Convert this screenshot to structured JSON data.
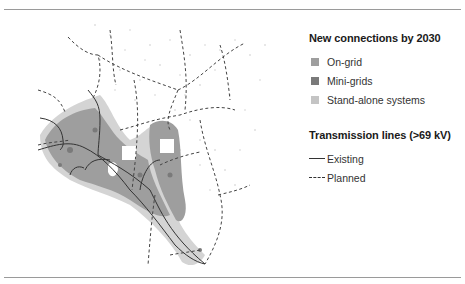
{
  "legend": {
    "connections": {
      "title": "New connections by 2030",
      "items": [
        {
          "label": "On-grid",
          "color": "#9e9e9e"
        },
        {
          "label": "Mini-grids",
          "color": "#7a7a7a"
        },
        {
          "label": "Stand-alone systems",
          "color": "#c4c4c4"
        }
      ]
    },
    "transmission": {
      "title": "Transmission lines (>69 kV)",
      "items": [
        {
          "label": "Existing",
          "style": "solid"
        },
        {
          "label": "Planned",
          "style": "dashed"
        }
      ]
    }
  },
  "map": {
    "region": "Kenya",
    "colors": {
      "on_grid": "#9e9e9e",
      "mini_grids": "#7a7a7a",
      "stand_alone": "#c4c4c4",
      "lines": "#333333"
    }
  }
}
